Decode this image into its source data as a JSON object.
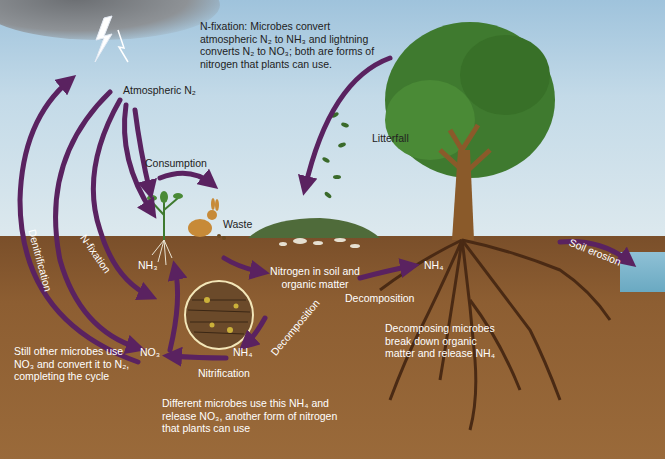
{
  "diagram": {
    "colors": {
      "sky_top": "#9fc3dc",
      "sky_bottom": "#dde9ee",
      "soil": "#8d5e32",
      "arrow_purple": "#5a2260",
      "tree_trunk": "#8a5a2a",
      "tree_canopy": "#3f7a2f",
      "text_dark": "#222222",
      "text_light": "#ffffff"
    },
    "callouts": {
      "n_fixation_note": "N-fixation: Microbes convert atmospheric N₂ to NH₃ and lightning converts N₂ to NO₃; both are forms of nitrogen that plants can use.",
      "denitrification_note": "Still other microbes use NO₃ and convert it to N₂, completing the cycle",
      "nitrification_note": "Different microbes use this NH₄ and release NO₃, another form of nitrogen that plants can use",
      "decomposition_note": "Decomposing microbes break down organic matter and release NH₄"
    },
    "labels": {
      "atmospheric_n2": "Atmospheric N₂",
      "consumption": "Consumption",
      "waste": "Waste",
      "litterfall": "Litterfall",
      "soil_nitrogen": "Nitrogen in soil and organic matter",
      "nh4_right": "NH₄",
      "decomposition_right": "Decomposition",
      "decomposition_center": "Decomposition",
      "soil_erosion": "Soil erosion",
      "nh3_plant": "NH₃",
      "no3": "NO₃",
      "nh4_center": "NH₄",
      "nitrification": "Nitrification",
      "n_fixation": "N-fixation",
      "denitrification": "Denitrification"
    },
    "icons": [
      "lightning-icon",
      "cloud-icon",
      "tree-icon",
      "rabbit-icon",
      "plant-icon",
      "microbe-circle-icon",
      "leaf-icon"
    ]
  }
}
